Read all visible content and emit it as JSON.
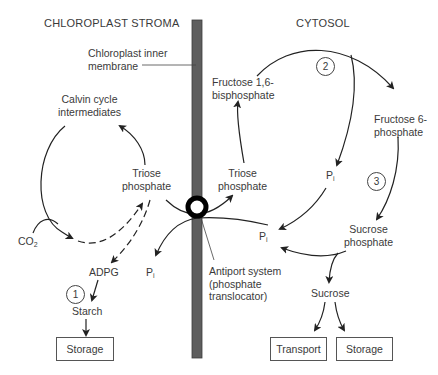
{
  "regions": {
    "stroma": "CHLOROPLAST STROMA",
    "cytosol": "CYTOSOL"
  },
  "membrane": {
    "label_line1": "Chloroplast inner",
    "label_line2": "membrane",
    "color": "#5e5e5e"
  },
  "stroma_nodes": {
    "calvin_line1": "Calvin cycle",
    "calvin_line2": "intermediates",
    "triose_line1": "Triose",
    "triose_line2": "phosphate",
    "co2_main": "CO",
    "co2_sub": "2",
    "adpg": "ADPG",
    "starch": "Starch",
    "pi_main": "P",
    "pi_sub": "i",
    "storage": "Storage",
    "step1": "1"
  },
  "cytosol_nodes": {
    "f16bp_line1": "Fructose 1,6-",
    "f16bp_line2": "bisphosphate",
    "f6p_line1": "Fructose 6-",
    "f6p_line2": "phosphate",
    "triose_line1": "Triose",
    "triose_line2": "phosphate",
    "pi_upper_main": "P",
    "pi_upper_sub": "i",
    "pi_lower_main": "P",
    "pi_lower_sub": "i",
    "sucrose_p_line1": "Sucrose",
    "sucrose_p_line2": "phosphate",
    "sucrose": "Sucrose",
    "transport": "Transport",
    "storage": "Storage",
    "step2": "2",
    "step3": "3"
  },
  "antiport": {
    "line1": "Antiport system",
    "line2": "(phosphate",
    "line3": "translocator)"
  }
}
